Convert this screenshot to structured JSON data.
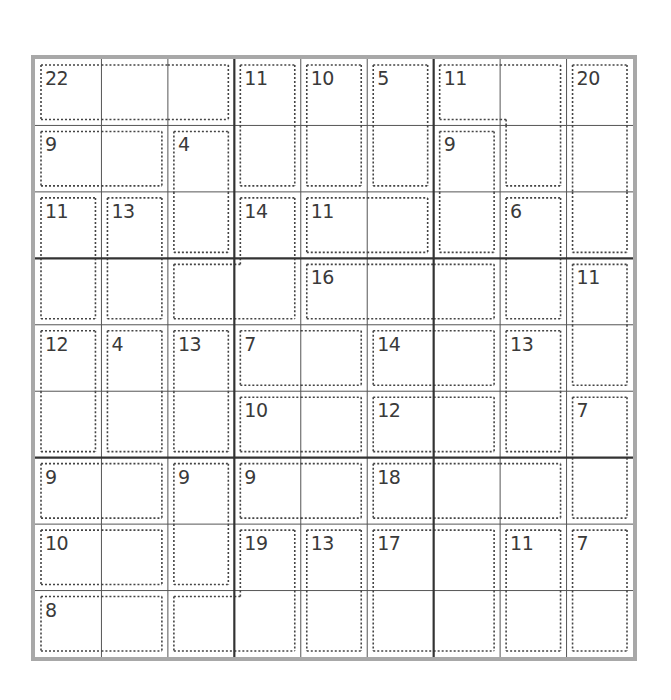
{
  "puzzle": {
    "type": "killer-sudoku",
    "size": 9,
    "colors": {
      "border": "#a8a8a8",
      "box_lines": "#333333",
      "cell_lines": "#555555",
      "cage_dots": "#444444",
      "clue_text": "#3a3a3a"
    },
    "cages": [
      {
        "sum": "22",
        "cells": [
          [
            0,
            0
          ],
          [
            0,
            1
          ],
          [
            0,
            2
          ]
        ]
      },
      {
        "sum": "11",
        "cells": [
          [
            0,
            3
          ],
          [
            1,
            3
          ]
        ]
      },
      {
        "sum": "10",
        "cells": [
          [
            0,
            4
          ],
          [
            1,
            4
          ]
        ]
      },
      {
        "sum": "5",
        "cells": [
          [
            0,
            5
          ],
          [
            1,
            5
          ]
        ]
      },
      {
        "sum": "11",
        "cells": [
          [
            0,
            6
          ],
          [
            0,
            7
          ],
          [
            1,
            7
          ]
        ]
      },
      {
        "sum": "20",
        "cells": [
          [
            0,
            8
          ],
          [
            1,
            8
          ],
          [
            2,
            8
          ]
        ]
      },
      {
        "sum": "9",
        "cells": [
          [
            1,
            0
          ],
          [
            1,
            1
          ]
        ]
      },
      {
        "sum": "4",
        "cells": [
          [
            1,
            2
          ],
          [
            2,
            2
          ]
        ]
      },
      {
        "sum": "9",
        "cells": [
          [
            1,
            6
          ],
          [
            2,
            6
          ]
        ]
      },
      {
        "sum": "11",
        "cells": [
          [
            2,
            0
          ],
          [
            3,
            0
          ]
        ]
      },
      {
        "sum": "13",
        "cells": [
          [
            2,
            1
          ],
          [
            3,
            1
          ]
        ]
      },
      {
        "sum": "14",
        "cells": [
          [
            2,
            3
          ],
          [
            3,
            3
          ],
          [
            3,
            2
          ]
        ]
      },
      {
        "sum": "11",
        "cells": [
          [
            2,
            4
          ],
          [
            2,
            5
          ]
        ]
      },
      {
        "sum": "6",
        "cells": [
          [
            2,
            7
          ],
          [
            3,
            7
          ]
        ]
      },
      {
        "sum": "16",
        "cells": [
          [
            3,
            4
          ],
          [
            3,
            5
          ],
          [
            3,
            6
          ]
        ]
      },
      {
        "sum": "11",
        "cells": [
          [
            3,
            8
          ],
          [
            4,
            8
          ]
        ]
      },
      {
        "sum": "12",
        "cells": [
          [
            4,
            0
          ],
          [
            5,
            0
          ]
        ]
      },
      {
        "sum": "4",
        "cells": [
          [
            4,
            1
          ],
          [
            5,
            1
          ]
        ]
      },
      {
        "sum": "13",
        "cells": [
          [
            4,
            2
          ],
          [
            5,
            2
          ]
        ]
      },
      {
        "sum": "7",
        "cells": [
          [
            4,
            3
          ],
          [
            4,
            4
          ]
        ]
      },
      {
        "sum": "14",
        "cells": [
          [
            4,
            5
          ],
          [
            4,
            6
          ]
        ]
      },
      {
        "sum": "13",
        "cells": [
          [
            4,
            7
          ],
          [
            5,
            7
          ]
        ]
      },
      {
        "sum": "10",
        "cells": [
          [
            5,
            3
          ],
          [
            5,
            4
          ]
        ]
      },
      {
        "sum": "12",
        "cells": [
          [
            5,
            5
          ],
          [
            5,
            6
          ]
        ]
      },
      {
        "sum": "7",
        "cells": [
          [
            5,
            8
          ],
          [
            6,
            8
          ]
        ]
      },
      {
        "sum": "9",
        "cells": [
          [
            6,
            0
          ],
          [
            6,
            1
          ]
        ]
      },
      {
        "sum": "9",
        "cells": [
          [
            6,
            2
          ],
          [
            7,
            2
          ]
        ]
      },
      {
        "sum": "9",
        "cells": [
          [
            6,
            3
          ],
          [
            6,
            4
          ]
        ]
      },
      {
        "sum": "18",
        "cells": [
          [
            6,
            5
          ],
          [
            6,
            6
          ],
          [
            6,
            7
          ]
        ]
      },
      {
        "sum": "10",
        "cells": [
          [
            7,
            0
          ],
          [
            7,
            1
          ]
        ]
      },
      {
        "sum": "19",
        "cells": [
          [
            7,
            3
          ],
          [
            8,
            3
          ],
          [
            8,
            2
          ]
        ]
      },
      {
        "sum": "13",
        "cells": [
          [
            7,
            4
          ],
          [
            8,
            4
          ]
        ]
      },
      {
        "sum": "17",
        "cells": [
          [
            7,
            5
          ],
          [
            7,
            6
          ],
          [
            8,
            5
          ],
          [
            8,
            6
          ]
        ]
      },
      {
        "sum": "11",
        "cells": [
          [
            7,
            7
          ],
          [
            8,
            7
          ]
        ]
      },
      {
        "sum": "7",
        "cells": [
          [
            7,
            8
          ],
          [
            8,
            8
          ]
        ]
      },
      {
        "sum": "8",
        "cells": [
          [
            8,
            0
          ],
          [
            8,
            1
          ]
        ]
      }
    ]
  }
}
